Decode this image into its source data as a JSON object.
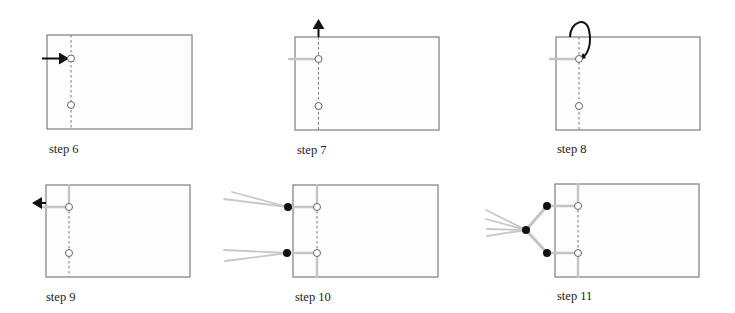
{
  "figure": {
    "steps": [
      {
        "id": "step6",
        "label": "step 6",
        "action": "arrow pointing right into top hole"
      },
      {
        "id": "step7",
        "label": "step 7",
        "action": "arrow pointing up along spine"
      },
      {
        "id": "step8",
        "label": "step 8",
        "action": "thread loops over top edge back to top hole"
      },
      {
        "id": "step9",
        "label": "step 9",
        "action": "arrow pointing left from top hole"
      },
      {
        "id": "step10",
        "label": "step 10",
        "action": "two knots with thread tails at each hole"
      },
      {
        "id": "step11",
        "label": "step 11",
        "action": "knots joined into a single tied bundle"
      }
    ],
    "colors": {
      "outline": "#888888",
      "dashed_spine": "#777777",
      "thread": "#c4c4c4",
      "knot": "#111111",
      "arrow": "#111111"
    },
    "icons": {
      "hole": "open-circle",
      "knot": "filled-circle",
      "arrow": "arrow"
    }
  }
}
